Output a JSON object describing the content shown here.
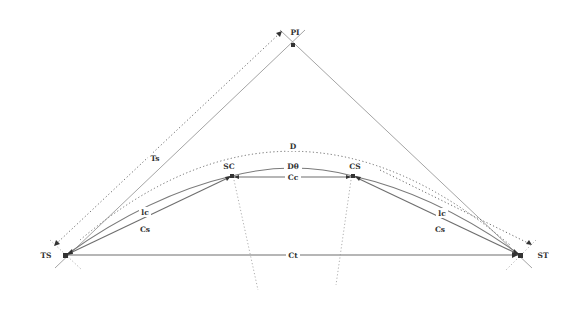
{
  "diagram": {
    "points": {
      "PI": "PI",
      "TS": "TS",
      "ST": "ST",
      "SC": "SC",
      "CS": "CS"
    },
    "labels": {
      "tangent_distance": "Ts",
      "external_arc": "D",
      "circular_arc": "Dθ",
      "circular_chord": "Cc",
      "total_chord": "Ct",
      "spiral_arc_left": "lc",
      "spiral_chord_left": "Cs",
      "spiral_arc_right": "lc",
      "spiral_chord_right": "Cs"
    },
    "colors": {
      "line": "#6e6e6e",
      "tangent": "#9a9a9a",
      "text": "#333333"
    }
  }
}
